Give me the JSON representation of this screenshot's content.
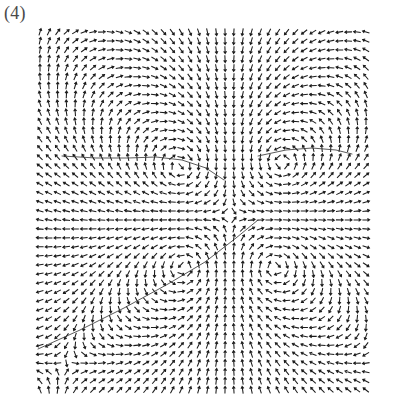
{
  "figure": {
    "panel_label": "(4)",
    "caption_text": "",
    "background_color": "#ffffff",
    "ink_color": "#1c1c1c",
    "separatrix_color": "#3c3c3c"
  },
  "chart_data": {
    "type": "scatter",
    "subtype": "quiver-vector-field",
    "title": "(4)",
    "subtitle": "",
    "xlabel": "",
    "ylabel": "",
    "xlim": [
      -1,
      1
    ],
    "ylim": [
      -1,
      1
    ],
    "grid": false,
    "legend": false,
    "legend_position": "none",
    "axes_visible": false,
    "tick_labels_x": [],
    "tick_labels_y": [],
    "plot_box_px": {
      "left": 40,
      "top": 32,
      "right": 366,
      "bottom": 390
    },
    "grid_dimensions": {
      "columns": 38,
      "rows": 41
    },
    "arrow_length_px": 7.2,
    "arrow_head_px": 2.6,
    "critical_points": [
      {
        "name": "vortex-upper-left",
        "type": "center",
        "circulation": "counter-clockwise",
        "x_px": 181,
        "y_px": 168,
        "strength": 1.0
      },
      {
        "name": "vortex-upper-right",
        "type": "center",
        "circulation": "clockwise",
        "x_px": 281,
        "y_px": 164,
        "strength": 1.0
      },
      {
        "name": "vortex-lower-left",
        "type": "center",
        "circulation": "clockwise",
        "x_px": 185,
        "y_px": 266,
        "strength": 1.0
      },
      {
        "name": "vortex-lower-right",
        "type": "center",
        "circulation": "counter-clockwise",
        "x_px": 274,
        "y_px": 266,
        "strength": 1.0
      },
      {
        "name": "saddle-centre",
        "type": "saddle",
        "circulation": "none",
        "x_px": 231,
        "y_px": 216,
        "strength": 0.8
      }
    ],
    "separatrices": [
      {
        "name": "separatrix-lower-left",
        "points_px": [
          [
            38,
            349
          ],
          [
            80,
            330
          ],
          [
            124,
            308
          ],
          [
            168,
            284
          ],
          [
            205,
            262
          ],
          [
            236,
            238
          ],
          [
            258,
            220
          ]
        ]
      },
      {
        "name": "separatrix-upper-left",
        "points_px": [
          [
            62,
            156
          ],
          [
            96,
            158
          ],
          [
            128,
            158
          ],
          [
            156,
            157
          ],
          [
            182,
            160
          ],
          [
            206,
            168
          ],
          [
            224,
            180
          ]
        ]
      },
      {
        "name": "separatrix-upper-right",
        "points_px": [
          [
            258,
            156
          ],
          [
            286,
            150
          ],
          [
            312,
            148
          ],
          [
            336,
            150
          ],
          [
            352,
            154
          ]
        ]
      }
    ],
    "series": [
      {
        "name": "velocity-field",
        "type": "quiver",
        "normalized": true,
        "sample_count": 1558,
        "note": "Arrow directions are generated from the superposition of four point vortices; only direction is plotted (unit length arrows)."
      }
    ]
  },
  "accessibility": {
    "alt_text": "Panel (4): a dense quiver plot of a two-dimensional vector field containing four vortices in a square arrangement with separatrix curves."
  }
}
